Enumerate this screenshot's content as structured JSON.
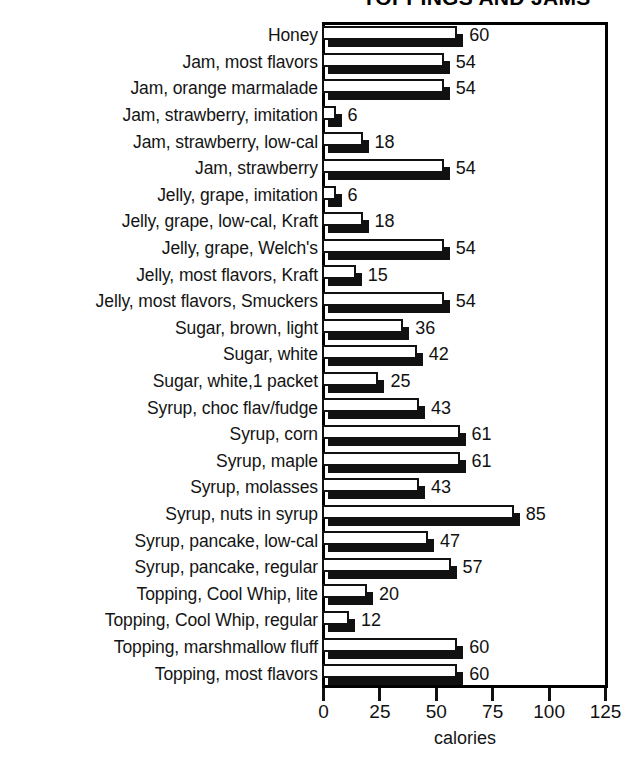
{
  "chart_data": {
    "type": "bar",
    "orientation": "horizontal",
    "title": "TOPPINGS AND JAMS",
    "xlabel": "calories",
    "ylabel": "",
    "xlim": [
      0,
      125
    ],
    "xticks": [
      0,
      25,
      50,
      75,
      100,
      125
    ],
    "grid": false,
    "legend": null,
    "value_labels_shown": true,
    "categories": [
      "Honey",
      "Jam, most flavors",
      "Jam, orange marmalade",
      "Jam, strawberry, imitation",
      "Jam, strawberry, low-cal",
      "Jam, strawberry",
      "Jelly, grape, imitation",
      "Jelly, grape, low-cal, Kraft",
      "Jelly, grape, Welch's",
      "Jelly, most flavors, Kraft",
      "Jelly, most flavors, Smuckers",
      "Sugar, brown, light",
      "Sugar, white",
      "Sugar, white,1 packet",
      "Syrup, choc flav/fudge",
      "Syrup, corn",
      "Syrup, maple",
      "Syrup, molasses",
      "Syrup, nuts in syrup",
      "Syrup, pancake, low-cal",
      "Syrup, pancake, regular",
      "Topping, Cool Whip, lite",
      "Topping, Cool Whip, regular",
      "Topping, marshmallow fluff",
      "Topping, most flavors"
    ],
    "values": [
      60,
      54,
      54,
      6,
      18,
      54,
      6,
      18,
      54,
      15,
      54,
      36,
      42,
      25,
      43,
      61,
      61,
      43,
      85,
      47,
      57,
      20,
      12,
      60,
      60
    ],
    "colors": {
      "bar_face": "#ffffff",
      "bar_outline": "#111111",
      "bar_shadow": "#111111",
      "axis": "#000000",
      "text": "#111111",
      "background": "#ffffff"
    }
  }
}
